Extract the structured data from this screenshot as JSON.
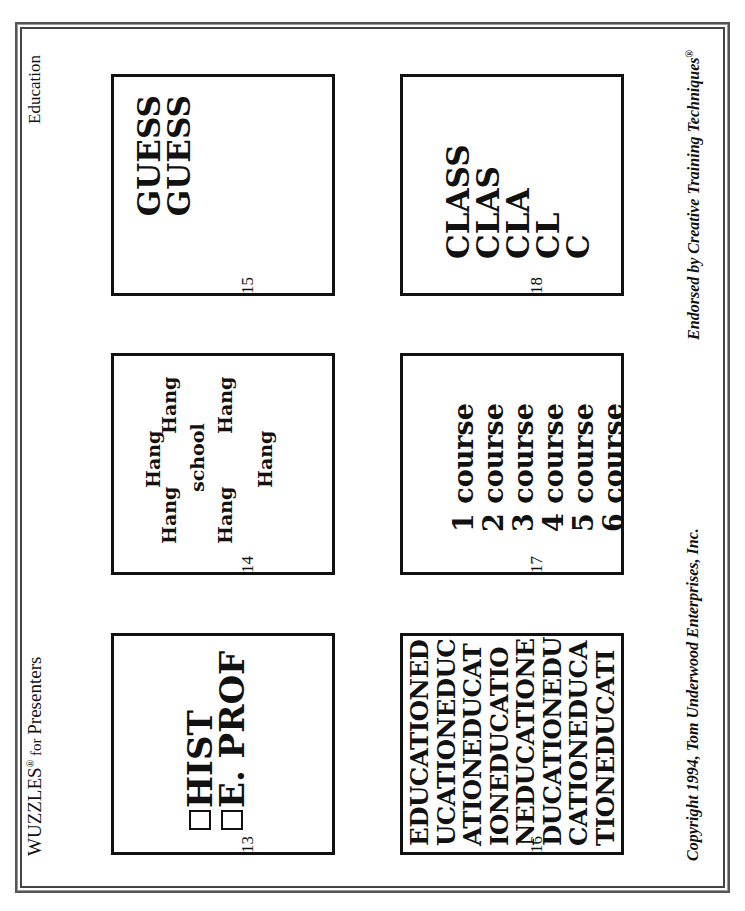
{
  "header": {
    "title_main": "WUZZLES",
    "title_mark": "®",
    "title_for": " for ",
    "title_rest": "Presenters",
    "category": "Education"
  },
  "footer": {
    "copyright": "Copyright 1994, Tom Underwood Enterprises, Inc.",
    "endorsement": "Endorsed by Creative Training Techniques",
    "endorsement_mark": "®"
  },
  "puzzles": [
    {
      "number": "13",
      "lines": [
        "HIST",
        "E. PROF"
      ],
      "checkbox_icon": "empty-square"
    },
    {
      "number": "14",
      "center_word": "school",
      "surround_word": "Hang",
      "surround_count": 6
    },
    {
      "number": "15",
      "lines": [
        "GUESS",
        "GUESS"
      ]
    },
    {
      "number": "16",
      "lines": [
        "EDUCATIONED",
        "UCATIONEDUC",
        "ATIONEDUCAT",
        "IONEDUCATIO",
        "NEDUCATIONE",
        "DUCATIONEDU",
        "CATIONEDUCA",
        "TIONEDUCATI"
      ]
    },
    {
      "number": "17",
      "lines": [
        "1 course",
        "2 course",
        "3 course",
        "4 course",
        "5 course",
        "6 course"
      ]
    },
    {
      "number": "18",
      "lines": [
        "CLASS",
        "CLAS",
        "CLA",
        "CL",
        "C"
      ]
    }
  ]
}
